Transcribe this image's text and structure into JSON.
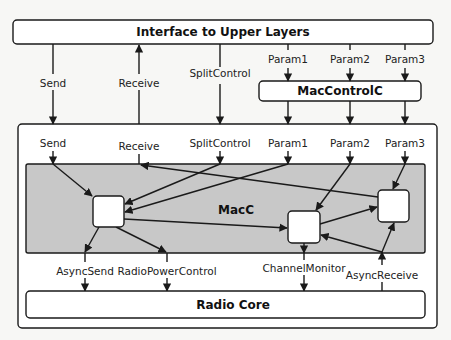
{
  "diagram": {
    "top_box": {
      "label": "Interface to Upper Layers"
    },
    "control_box": {
      "label": "MacControlC"
    },
    "mac_box": {
      "label": "MacC",
      "fill": "#c8c8c8"
    },
    "radio_box": {
      "label": "Radio Core"
    },
    "upper_interfaces": {
      "send": "Send",
      "receive": "Receive",
      "split_control": "SplitControl",
      "param1": "Param1",
      "param2": "Param2",
      "param3": "Param3"
    },
    "inner_interfaces": {
      "send": "Send",
      "receive": "Receive",
      "split_control": "SplitControl",
      "param1": "Param1",
      "param2": "Param2",
      "param3": "Param3"
    },
    "lower_interfaces": {
      "async_send": "AsyncSend",
      "radio_power_control": "RadioPowerControl",
      "channel_monitor": "ChannelMonitor",
      "async_receive": "AsyncReceive"
    }
  }
}
